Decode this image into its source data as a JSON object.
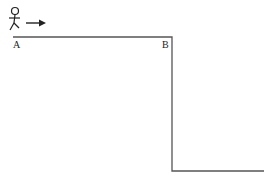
{
  "diagram": {
    "labels": {
      "start": "A",
      "edge": "B"
    },
    "elements": {
      "figure": "stick-figure",
      "arrow": "right-arrow",
      "path": "cliff-path"
    },
    "colors": {
      "line": "#555555",
      "figure": "#222222"
    }
  }
}
